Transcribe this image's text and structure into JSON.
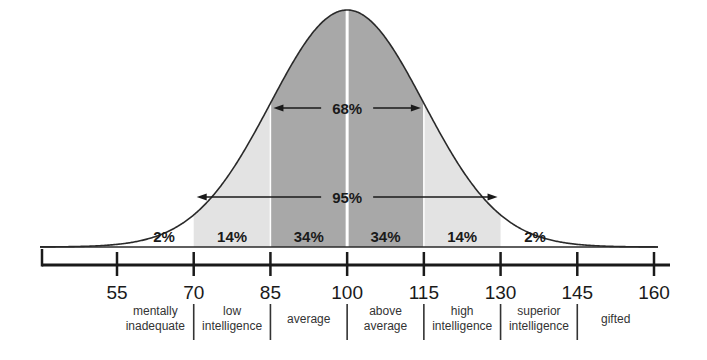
{
  "chart_data": {
    "type": "area",
    "title": "",
    "xlabel": "",
    "ylabel": "",
    "xlim": [
      40,
      160
    ],
    "mean": 100,
    "sd": 15,
    "ticks": [
      55,
      70,
      85,
      100,
      115,
      130,
      145,
      160
    ],
    "tick_labels": [
      "55",
      "70",
      "85",
      "100",
      "115",
      "130",
      "145",
      "160"
    ],
    "bands": [
      {
        "from": 40,
        "to": 70,
        "percent": "2%",
        "label": "2%",
        "shade": "none"
      },
      {
        "from": 70,
        "to": 85,
        "percent": "14%",
        "label": "14%",
        "shade": "light"
      },
      {
        "from": 85,
        "to": 100,
        "percent": "34%",
        "label": "34%",
        "shade": "dark"
      },
      {
        "from": 100,
        "to": 115,
        "percent": "34%",
        "label": "34%",
        "shade": "dark"
      },
      {
        "from": 115,
        "to": 130,
        "percent": "14%",
        "label": "14%",
        "shade": "light"
      },
      {
        "from": 130,
        "to": 160,
        "percent": "2%",
        "label": "2%",
        "shade": "none"
      }
    ],
    "spans": [
      {
        "from": 85,
        "to": 115,
        "label": "68%"
      },
      {
        "from": 70,
        "to": 130,
        "label": "95%"
      }
    ],
    "categories": [
      {
        "from": 55,
        "to": 70,
        "line1": "mentally",
        "line2": "inadequate"
      },
      {
        "from": 70,
        "to": 85,
        "line1": "low",
        "line2": "intelligence"
      },
      {
        "from": 85,
        "to": 100,
        "line1": "average",
        "line2": ""
      },
      {
        "from": 100,
        "to": 115,
        "line1": "above",
        "line2": "average"
      },
      {
        "from": 115,
        "to": 130,
        "line1": "high",
        "line2": "intelligence"
      },
      {
        "from": 130,
        "to": 145,
        "line1": "superior",
        "line2": "intelligence"
      },
      {
        "from": 145,
        "to": 160,
        "line1": "gifted",
        "line2": ""
      }
    ],
    "colors": {
      "curve": "#2a2a2a",
      "dark_band": "#a8a8a8",
      "light_band": "#e3e3e3",
      "axis": "#1a1a1a",
      "divider": "#ffffff"
    },
    "grid": false,
    "legend": "none"
  }
}
